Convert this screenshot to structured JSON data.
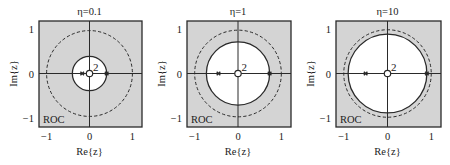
{
  "figure": {
    "background": "#ffffff",
    "roc_fill": "#d4d4d4",
    "inner_fill": "#ffffff",
    "line_color": "#2a2a2a"
  },
  "chart_data": [
    {
      "type": "pole-zero",
      "title": "η=0.1",
      "eta": 0.1,
      "xlabel": "Re{z}",
      "ylabel": "Im{z}",
      "xlim": [
        -1.2,
        1.2
      ],
      "ylim": [
        -1.2,
        1.2
      ],
      "xticks": [
        -1,
        0,
        1
      ],
      "yticks": [
        -1,
        0,
        1
      ],
      "xtick_labels": [
        "−1",
        "0",
        "1"
      ],
      "ytick_labels": [
        "1",
        "0",
        "−1"
      ],
      "unit_circle": {
        "radius": 1.0,
        "style": "dashed"
      },
      "roc_boundary": {
        "radius": 0.4,
        "style": "solid"
      },
      "roc_label": "ROC",
      "roc_region": "|z| > 0.4",
      "zeros": [
        {
          "re": 0,
          "im": 0,
          "multiplicity": 2,
          "label": "2"
        }
      ],
      "poles": [
        {
          "re": -0.17,
          "im": 0
        },
        {
          "re": 0.4,
          "im": 0
        }
      ],
      "box": {
        "x": 39,
        "y": 21,
        "w": 103,
        "h": 106
      }
    },
    {
      "type": "pole-zero",
      "title": "η=1",
      "eta": 1,
      "xlabel": "Re{z}",
      "ylabel": "Im{z}",
      "xlim": [
        -1.2,
        1.2
      ],
      "ylim": [
        -1.2,
        1.2
      ],
      "xticks": [
        -1,
        0,
        1
      ],
      "yticks": [
        -1,
        0,
        1
      ],
      "xtick_labels": [
        "−1",
        "0",
        "1"
      ],
      "ytick_labels": [
        "1",
        "0",
        "−1"
      ],
      "unit_circle": {
        "radius": 1.0,
        "style": "dashed"
      },
      "roc_boundary": {
        "radius": 0.73,
        "style": "solid"
      },
      "roc_label": "ROC",
      "roc_region": "|z| > 0.73",
      "zeros": [
        {
          "re": 0,
          "im": 0,
          "multiplicity": 2,
          "label": "2"
        }
      ],
      "poles": [
        {
          "re": -0.45,
          "im": 0
        },
        {
          "re": 0.73,
          "im": 0
        }
      ],
      "box": {
        "x": 187,
        "y": 21,
        "w": 104,
        "h": 106
      }
    },
    {
      "type": "pole-zero",
      "title": "η=10",
      "eta": 10,
      "xlabel": "Re{z}",
      "ylabel": "Im{z}",
      "xlim": [
        -1.2,
        1.2
      ],
      "ylim": [
        -1.2,
        1.2
      ],
      "xticks": [
        -1,
        0,
        1
      ],
      "yticks": [
        -1,
        0,
        1
      ],
      "xtick_labels": [
        "−1",
        "0",
        "1"
      ],
      "ytick_labels": [
        "1",
        "0",
        "−1"
      ],
      "unit_circle": {
        "radius": 1.0,
        "style": "dashed"
      },
      "roc_boundary": {
        "radius": 0.9,
        "style": "solid"
      },
      "roc_label": "ROC",
      "roc_region": "|z| > 0.9",
      "zeros": [
        {
          "re": 0,
          "im": 0,
          "multiplicity": 2,
          "label": "2"
        }
      ],
      "poles": [
        {
          "re": -0.5,
          "im": 0
        },
        {
          "re": 0.9,
          "im": 0
        }
      ],
      "box": {
        "x": 336,
        "y": 21,
        "w": 105,
        "h": 106
      }
    }
  ]
}
